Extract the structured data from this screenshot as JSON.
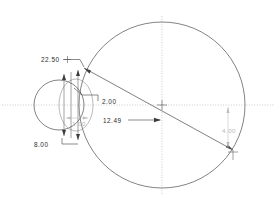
{
  "drawing": {
    "title": "Two-circle tangent layout dimensioned drawing",
    "background_color": "#ffffff",
    "line_color": "#4a4a4a",
    "centerline_color": "#a9a9a9",
    "text_color": "#2b2b2b",
    "faint_text_color": "#b9b9b9"
  },
  "dimensions": [
    {
      "id": "angle-upper-left",
      "label": "22.50",
      "kind": "angle",
      "x": 41,
      "y": 62
    },
    {
      "id": "offset-vertical-small",
      "label": "2.00",
      "kind": "linear",
      "x": 102,
      "y": 104
    },
    {
      "id": "center-distance",
      "label": "12.49",
      "kind": "linear",
      "x": 103,
      "y": 123
    },
    {
      "id": "small-circle-diameter",
      "label": "8.00",
      "kind": "linear",
      "x": 34,
      "y": 147
    },
    {
      "id": "inner-width-faint",
      "label": "1.00",
      "kind": "linear-faint",
      "x": 72,
      "y": 126
    },
    {
      "id": "vertical-drop-right",
      "label": "4.00",
      "kind": "linear-faint",
      "x": 222,
      "y": 133
    }
  ],
  "geometry": {
    "large_circle": {
      "cx": 162,
      "cy": 105,
      "r": 83
    },
    "small_circle": {
      "cx": 59,
      "cy": 105,
      "r": 25
    },
    "inner_arc": {
      "cx": 76,
      "cy": 105,
      "rx": 17,
      "ry": 26
    },
    "centerline_horizontal": {
      "x1": 2,
      "y1": 105,
      "x2": 275,
      "y2": 105
    },
    "centerline_vertical": {
      "x1": 162,
      "y1": 16,
      "x2": 162,
      "y2": 195
    },
    "tangent_line": {
      "x1": 84,
      "y1": 68,
      "x2": 233,
      "y2": 150
    }
  },
  "icons": {
    "center_mark": "crosshair-icon",
    "arrow": "arrow-head-icon"
  }
}
